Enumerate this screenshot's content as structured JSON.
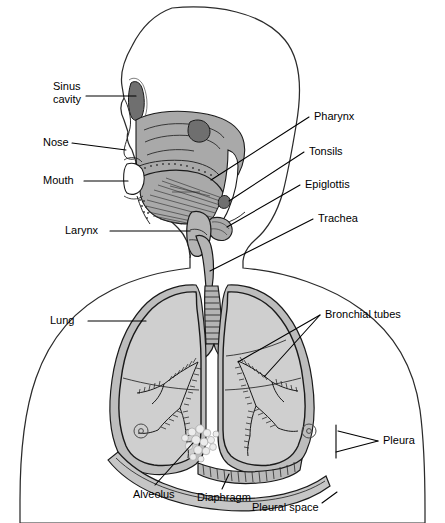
{
  "figure": {
    "width": 445,
    "height": 523,
    "background": "#ffffff"
  },
  "colors": {
    "outline_stroke": "#2b2b2b",
    "lung_fill": "#cfcfcf",
    "facial_tissue": "#a9a9a9",
    "sinus_dark": "#6f6f6f",
    "airway_fill": "#b4b4b4",
    "pleura_fill": "#bdbdbd",
    "label_text": "#000000",
    "alveolus_fill": "#ececec"
  },
  "labels": {
    "sinus_cavity": {
      "line1": "Sinus",
      "line2": "cavity"
    },
    "nose": "Nose",
    "mouth": "Mouth",
    "larynx": "Larynx",
    "pharynx": "Pharynx",
    "tonsils": "Tonsils",
    "epiglottis": "Epiglottis",
    "trachea": "Trachea",
    "bronchial_tubes": "Bronchial tubes",
    "lung": "Lung",
    "pleura": "Pleura",
    "alveolus": "Alveolus",
    "diaphragm": "Diaphragm",
    "pleural_space": "Pleural space"
  },
  "label_list": [
    {
      "id": "sinus-cavity",
      "text": "Sinus cavity",
      "side": "left"
    },
    {
      "id": "nose",
      "text": "Nose",
      "side": "left"
    },
    {
      "id": "mouth",
      "text": "Mouth",
      "side": "left"
    },
    {
      "id": "larynx",
      "text": "Larynx",
      "side": "left"
    },
    {
      "id": "lung",
      "text": "Lung",
      "side": "left"
    },
    {
      "id": "alveolus",
      "text": "Alveolus",
      "side": "bottom"
    },
    {
      "id": "diaphragm",
      "text": "Diaphragm",
      "side": "bottom"
    },
    {
      "id": "pleural-space",
      "text": "Pleural space",
      "side": "bottom"
    },
    {
      "id": "pharynx",
      "text": "Pharynx",
      "side": "right"
    },
    {
      "id": "tonsils",
      "text": "Tonsils",
      "side": "right"
    },
    {
      "id": "epiglottis",
      "text": "Epiglottis",
      "side": "right"
    },
    {
      "id": "trachea",
      "text": "Trachea",
      "side": "right"
    },
    {
      "id": "bronchial-tubes",
      "text": "Bronchial tubes",
      "side": "right"
    },
    {
      "id": "pleura",
      "text": "Pleura",
      "side": "right"
    }
  ]
}
